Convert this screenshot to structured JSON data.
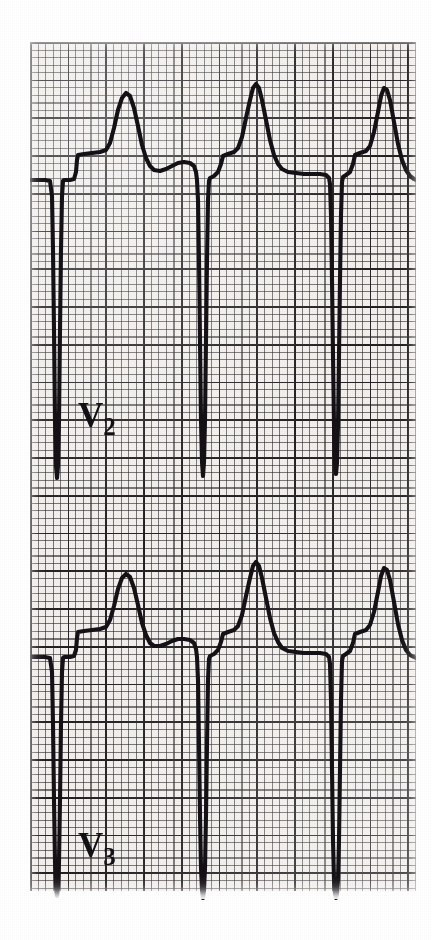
{
  "figure": {
    "kind": "ecg-rhythm-strip",
    "paper_background_color": "#f2efec",
    "grid_line_color": "#282628",
    "grid_bold_line_color": "#141214",
    "trace_color": "#141216",
    "page_background_color": "#ffffff",
    "small_box_px": 7.55,
    "large_box_px": 37.75
  },
  "leads": [
    {
      "id": "v2",
      "label_letter": "V",
      "label_subscript": "2",
      "label_full": "V2",
      "baseline_y": 180,
      "beats": 3
    },
    {
      "id": "v3",
      "label_letter": "V",
      "label_subscript": "3",
      "label_full": "V3",
      "baseline_y": 657,
      "beats": 3
    }
  ],
  "chart_data": {
    "type": "line",
    "title": "",
    "xlabel": "",
    "ylabel": "",
    "grid": true,
    "legend_position": "inline-left",
    "paper_speed": "25 mm/s",
    "gain": "10 mm/mV",
    "series": [
      {
        "name": "V2",
        "baseline_y": 180,
        "points": [
          [
            30,
            180
          ],
          [
            45,
            180
          ],
          [
            50,
            181
          ],
          [
            52,
            196
          ],
          [
            53,
            250
          ],
          [
            54,
            330
          ],
          [
            55,
            420
          ],
          [
            56,
            466
          ],
          [
            57,
            478
          ],
          [
            58,
            466
          ],
          [
            59,
            420
          ],
          [
            60,
            330
          ],
          [
            61,
            250
          ],
          [
            62,
            196
          ],
          [
            63,
            181
          ],
          [
            64,
            180
          ],
          [
            70,
            180
          ],
          [
            74,
            179
          ],
          [
            76,
            172
          ],
          [
            77,
            160
          ],
          [
            78,
            155
          ],
          [
            84,
            154
          ],
          [
            92,
            153
          ],
          [
            100,
            152
          ],
          [
            106,
            150
          ],
          [
            110,
            143
          ],
          [
            114,
            128
          ],
          [
            118,
            110
          ],
          [
            122,
            98
          ],
          [
            126,
            93
          ],
          [
            130,
            96
          ],
          [
            134,
            108
          ],
          [
            138,
            126
          ],
          [
            142,
            145
          ],
          [
            146,
            158
          ],
          [
            150,
            166
          ],
          [
            154,
            170
          ],
          [
            160,
            171
          ],
          [
            166,
            169
          ],
          [
            172,
            166
          ],
          [
            178,
            163
          ],
          [
            184,
            162
          ],
          [
            190,
            163
          ],
          [
            194,
            166
          ],
          [
            196,
            172
          ],
          [
            197,
            180
          ],
          [
            198,
            200
          ],
          [
            199,
            260
          ],
          [
            200,
            340
          ],
          [
            201,
            420
          ],
          [
            202,
            462
          ],
          [
            203,
            476
          ],
          [
            204,
            462
          ],
          [
            205,
            420
          ],
          [
            206,
            340
          ],
          [
            207,
            260
          ],
          [
            208,
            200
          ],
          [
            209,
            181
          ],
          [
            210,
            178
          ],
          [
            214,
            176
          ],
          [
            218,
            172
          ],
          [
            221,
            164
          ],
          [
            223,
            156
          ],
          [
            228,
            154
          ],
          [
            234,
            152
          ],
          [
            238,
            148
          ],
          [
            242,
            137
          ],
          [
            246,
            118
          ],
          [
            250,
            100
          ],
          [
            253,
            88
          ],
          [
            256,
            84
          ],
          [
            259,
            88
          ],
          [
            262,
            100
          ],
          [
            266,
            120
          ],
          [
            270,
            140
          ],
          [
            274,
            155
          ],
          [
            278,
            164
          ],
          [
            282,
            169
          ],
          [
            288,
            172
          ],
          [
            296,
            173
          ],
          [
            304,
            174
          ],
          [
            312,
            174
          ],
          [
            320,
            174
          ],
          [
            326,
            175
          ],
          [
            329,
            178
          ],
          [
            330,
            184
          ],
          [
            331,
            215
          ],
          [
            332,
            280
          ],
          [
            333,
            355
          ],
          [
            334,
            425
          ],
          [
            335,
            463
          ],
          [
            336,
            474
          ],
          [
            337,
            463
          ],
          [
            338,
            425
          ],
          [
            339,
            355
          ],
          [
            340,
            280
          ],
          [
            341,
            215
          ],
          [
            342,
            182
          ],
          [
            343,
            177
          ],
          [
            346,
            175
          ],
          [
            350,
            172
          ],
          [
            353,
            164
          ],
          [
            355,
            155
          ],
          [
            360,
            153
          ],
          [
            366,
            151
          ],
          [
            370,
            146
          ],
          [
            374,
            132
          ],
          [
            378,
            112
          ],
          [
            381,
            96
          ],
          [
            384,
            88
          ],
          [
            387,
            90
          ],
          [
            390,
            100
          ],
          [
            394,
            122
          ],
          [
            398,
            144
          ],
          [
            402,
            160
          ],
          [
            406,
            170
          ],
          [
            410,
            176
          ],
          [
            414,
            179
          ],
          [
            416,
            180
          ]
        ]
      },
      {
        "name": "V3",
        "baseline_y": 657,
        "points": [
          [
            30,
            657
          ],
          [
            45,
            657
          ],
          [
            50,
            658
          ],
          [
            52,
            672
          ],
          [
            53,
            724
          ],
          [
            54,
            800
          ],
          [
            55,
            862
          ],
          [
            56,
            888
          ],
          [
            57,
            896
          ],
          [
            58,
            888
          ],
          [
            59,
            862
          ],
          [
            60,
            800
          ],
          [
            61,
            724
          ],
          [
            62,
            672
          ],
          [
            63,
            658
          ],
          [
            64,
            657
          ],
          [
            70,
            657
          ],
          [
            74,
            656
          ],
          [
            76,
            650
          ],
          [
            77,
            638
          ],
          [
            78,
            632
          ],
          [
            84,
            631
          ],
          [
            92,
            630
          ],
          [
            100,
            629
          ],
          [
            106,
            627
          ],
          [
            110,
            620
          ],
          [
            114,
            606
          ],
          [
            118,
            589
          ],
          [
            122,
            578
          ],
          [
            126,
            574
          ],
          [
            130,
            577
          ],
          [
            134,
            588
          ],
          [
            138,
            605
          ],
          [
            142,
            623
          ],
          [
            146,
            635
          ],
          [
            150,
            643
          ],
          [
            154,
            646
          ],
          [
            160,
            646
          ],
          [
            166,
            644
          ],
          [
            172,
            641
          ],
          [
            178,
            639
          ],
          [
            184,
            639
          ],
          [
            190,
            640
          ],
          [
            194,
            643
          ],
          [
            196,
            649
          ],
          [
            197,
            657
          ],
          [
            198,
            680
          ],
          [
            199,
            745
          ],
          [
            200,
            815
          ],
          [
            201,
            868
          ],
          [
            202,
            890
          ],
          [
            203,
            898
          ],
          [
            204,
            890
          ],
          [
            205,
            868
          ],
          [
            206,
            815
          ],
          [
            207,
            745
          ],
          [
            208,
            680
          ],
          [
            209,
            659
          ],
          [
            210,
            656
          ],
          [
            214,
            654
          ],
          [
            218,
            650
          ],
          [
            221,
            642
          ],
          [
            223,
            634
          ],
          [
            228,
            632
          ],
          [
            234,
            630
          ],
          [
            238,
            626
          ],
          [
            242,
            615
          ],
          [
            246,
            596
          ],
          [
            250,
            578
          ],
          [
            253,
            566
          ],
          [
            256,
            562
          ],
          [
            259,
            566
          ],
          [
            262,
            578
          ],
          [
            266,
            598
          ],
          [
            270,
            618
          ],
          [
            274,
            633
          ],
          [
            278,
            642
          ],
          [
            282,
            648
          ],
          [
            288,
            651
          ],
          [
            296,
            652
          ],
          [
            304,
            653
          ],
          [
            312,
            653
          ],
          [
            320,
            653
          ],
          [
            326,
            654
          ],
          [
            329,
            657
          ],
          [
            330,
            664
          ],
          [
            331,
            700
          ],
          [
            332,
            770
          ],
          [
            333,
            840
          ],
          [
            334,
            880
          ],
          [
            335,
            894
          ],
          [
            336,
            898
          ],
          [
            337,
            894
          ],
          [
            338,
            880
          ],
          [
            339,
            840
          ],
          [
            340,
            770
          ],
          [
            341,
            700
          ],
          [
            342,
            661
          ],
          [
            343,
            656
          ],
          [
            346,
            654
          ],
          [
            350,
            651
          ],
          [
            353,
            643
          ],
          [
            355,
            634
          ],
          [
            360,
            632
          ],
          [
            366,
            630
          ],
          [
            370,
            625
          ],
          [
            374,
            612
          ],
          [
            378,
            592
          ],
          [
            381,
            576
          ],
          [
            384,
            568
          ],
          [
            387,
            570
          ],
          [
            390,
            580
          ],
          [
            394,
            602
          ],
          [
            398,
            624
          ],
          [
            402,
            640
          ],
          [
            406,
            650
          ],
          [
            410,
            655
          ],
          [
            414,
            657
          ],
          [
            416,
            658
          ]
        ]
      }
    ]
  }
}
